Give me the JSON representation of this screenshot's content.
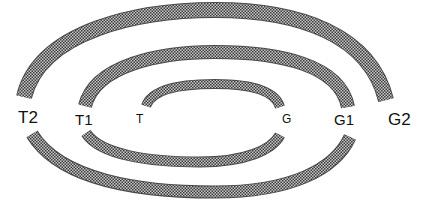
{
  "diagram": {
    "type": "nested-arcs",
    "fill": {
      "pattern": "checker",
      "dark": "#3a3a3a",
      "light": "#c8c8c8",
      "edge": "#4a4a4a"
    },
    "labels": {
      "t2": "T2",
      "t1": "T1",
      "t": "T",
      "g": "G",
      "g1": "G1",
      "g2": "G2"
    },
    "arcs": [
      {
        "id": "outer-top",
        "from": "T2",
        "to": "G2"
      },
      {
        "id": "outer-bottom",
        "from": "T2",
        "to": "G1"
      },
      {
        "id": "middle-top",
        "from": "T1",
        "to": "G1"
      },
      {
        "id": "middle-bottom",
        "from": "T1",
        "to": "G"
      },
      {
        "id": "inner-top",
        "from": "T",
        "to": "G"
      }
    ]
  }
}
